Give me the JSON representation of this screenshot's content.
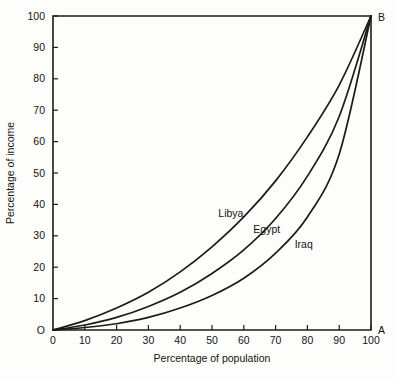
{
  "chart_data": {
    "type": "line",
    "title": "",
    "subtitle": "",
    "xlabel": "Percentage of population",
    "ylabel": "Percentage of income",
    "xlim": [
      0,
      100
    ],
    "ylim": [
      0,
      100
    ],
    "grid": false,
    "legend_position": "inline-curve-labels",
    "x_ticks": [
      "0",
      "10",
      "20",
      "30",
      "40",
      "50",
      "60",
      "70",
      "80",
      "90",
      "100"
    ],
    "y_ticks": [
      "O",
      "10",
      "20",
      "30",
      "40",
      "50",
      "60",
      "70",
      "80",
      "90",
      "100"
    ],
    "x_tick_values": [
      0,
      10,
      20,
      30,
      40,
      50,
      60,
      70,
      80,
      90,
      100
    ],
    "y_tick_values": [
      0,
      10,
      20,
      30,
      40,
      50,
      60,
      70,
      80,
      90,
      100
    ],
    "origin_label": "O",
    "corner_labels": [
      {
        "name": "A",
        "text": "A",
        "x": 100,
        "y": 0
      },
      {
        "name": "B",
        "text": "B",
        "x": 100,
        "y": 100
      }
    ],
    "x": [
      0,
      10,
      20,
      30,
      40,
      50,
      60,
      70,
      80,
      90,
      100
    ],
    "series": [
      {
        "name": "Libya",
        "label": "Libya",
        "color": "#1b1b1b",
        "label_x": 52,
        "label_y": 36,
        "values": [
          0,
          3.0,
          7.0,
          12.0,
          18.5,
          26.5,
          36.0,
          47.5,
          61.5,
          78.0,
          100
        ]
      },
      {
        "name": "Egypt",
        "label": "Egypt",
        "color": "#1b1b1b",
        "label_x": 63,
        "label_y": 31,
        "values": [
          0,
          1.6,
          4.0,
          7.5,
          12.0,
          18.0,
          25.5,
          35.5,
          49.0,
          68.0,
          100
        ]
      },
      {
        "name": "Iraq",
        "label": "Iraq",
        "color": "#1b1b1b",
        "label_x": 76,
        "label_y": 26,
        "values": [
          0,
          0.8,
          2.0,
          4.0,
          7.0,
          11.0,
          16.5,
          24.5,
          36.0,
          56.0,
          100
        ]
      }
    ]
  },
  "figure": {
    "background": "#fdfdfb",
    "line_color": "#1b1b1b"
  }
}
